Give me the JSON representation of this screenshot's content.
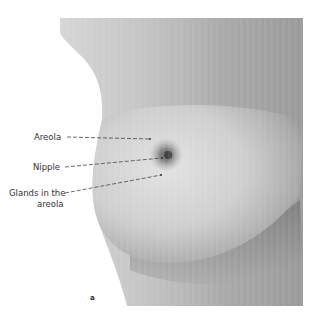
{
  "figure": {
    "letter": "a",
    "labels": [
      {
        "id": "areola",
        "text": "Areola"
      },
      {
        "id": "nipple",
        "text": "Nipple"
      },
      {
        "id": "glands_line1",
        "text": "Glands in the"
      },
      {
        "id": "glands_line2",
        "text": "areola"
      }
    ]
  }
}
